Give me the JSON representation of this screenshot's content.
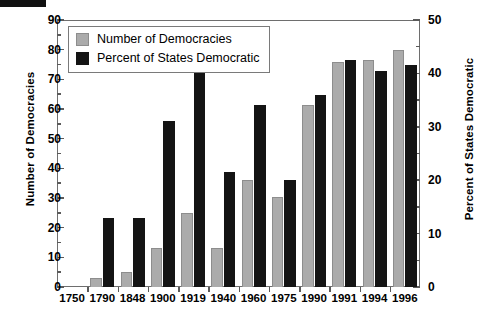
{
  "chart_data": {
    "type": "bar",
    "title": "",
    "subtitle": "",
    "xlabel": "",
    "ylabel": "Number of Democracies",
    "ylabel_right": "Percent of States Democratic",
    "categories": [
      "1750",
      "1790",
      "1848",
      "1900",
      "1919",
      "1940",
      "1960",
      "1975",
      "1990",
      "1991",
      "1994",
      "1996"
    ],
    "ylim": [
      0,
      90
    ],
    "ylim_right": [
      0,
      50
    ],
    "yticks": [
      0,
      10,
      20,
      30,
      40,
      50,
      60,
      70,
      80,
      90
    ],
    "yticks_right": [
      0,
      10,
      20,
      30,
      40,
      50
    ],
    "y_minor_step": 5,
    "y_minor_step_right": 5,
    "grid": false,
    "legend_position": "upper-left",
    "series": [
      {
        "name": "Number of Democracies",
        "axis": "left",
        "color": "#ababab",
        "values": [
          0,
          3,
          5,
          13,
          25,
          13,
          36,
          30.5,
          61.5,
          76,
          76.5,
          80
        ]
      },
      {
        "name": "Percent of States Democratic",
        "axis": "right",
        "color": "#141414",
        "values": [
          0,
          13,
          13,
          31,
          41.5,
          21.5,
          34,
          20,
          36,
          42.5,
          40.5,
          41.5
        ]
      }
    ],
    "annotations": []
  },
  "legend": {
    "items": [
      {
        "label": "Number of Democracies",
        "swatch": "gray"
      },
      {
        "label": "Percent of States Democratic",
        "swatch": "black"
      }
    ]
  },
  "axes": {
    "left": {
      "title": "Number of Democracies",
      "ticks": [
        "0",
        "10",
        "20",
        "30",
        "40",
        "50",
        "60",
        "70",
        "80",
        "90"
      ]
    },
    "right": {
      "title": "Percent of States Democratic",
      "ticks": [
        "0",
        "10",
        "20",
        "30",
        "40",
        "50"
      ]
    },
    "bottom": {
      "ticks": [
        "1750",
        "1790",
        "1848",
        "1900",
        "1919",
        "1940",
        "1960",
        "1975",
        "1990",
        "1991",
        "1994",
        "1996"
      ]
    }
  }
}
